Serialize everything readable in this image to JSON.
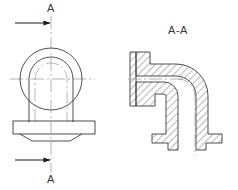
{
  "drawing": {
    "kind": "engineering-drawing",
    "title_visible": false,
    "background_color": "#ffffff",
    "line_color": "#3a3a3a",
    "center_line_color": "#9aa0a6",
    "hatch_color": "#55595e"
  },
  "labels": {
    "section_arrow_top": "A",
    "section_arrow_bottom": "A",
    "section_view_title": "A-A"
  },
  "views": {
    "front_view": {
      "name": "front-view",
      "description": "Circular boss with arched inner profile over a rectangular flange base",
      "center_x": 51,
      "center_y": 79,
      "circle_radius": 31,
      "arch_outer_half_width": 22,
      "arch_inner_half_width": 16,
      "flange_left": 13,
      "flange_right": 95,
      "flange_top": 121,
      "flange_bottom": 133,
      "chamfer_bottom": 141
    },
    "section_view": {
      "name": "section-view-a-a",
      "description": "90 degree elbow pipe shown in full section with 45 degree cross hatching, horizontal inlet flange at left and vertical outlet flange at bottom",
      "bend_angle_deg": 90,
      "inlet_flange_x": 136,
      "outlet_flange_y": 143,
      "vertical_center_x": 196,
      "horizontal_center_y": 79
    }
  },
  "annotations": {
    "top_cutting_arrow": {
      "name": "cutting-plane-arrow-top",
      "direction": "right",
      "tail_x": 15,
      "head_x": 51,
      "y": 23
    },
    "bottom_cutting_arrow": {
      "name": "cutting-plane-arrow-bottom",
      "direction": "right",
      "tail_x": 15,
      "head_x": 51,
      "y": 160
    },
    "vertical_cutting_line": {
      "name": "cutting-plane-line",
      "x": 51,
      "y_top": 16,
      "y_bottom": 172
    }
  }
}
